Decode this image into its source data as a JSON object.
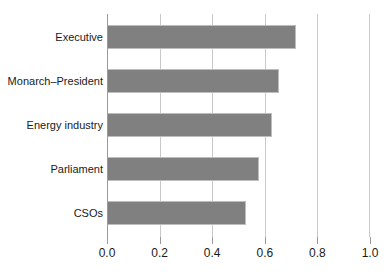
{
  "chart_data": {
    "type": "bar",
    "orientation": "horizontal",
    "title": "",
    "subtitle": "",
    "xlabel": "",
    "ylabel": "",
    "categories": [
      "Executive",
      "Monarch–President",
      "Energy industry",
      "Parliament",
      "CSOs"
    ],
    "values": [
      0.72,
      0.655,
      0.627,
      0.578,
      0.528
    ],
    "series": [
      {
        "name": "",
        "values": [
          0.72,
          0.655,
          0.627,
          0.578,
          0.528
        ]
      }
    ],
    "xlim": [
      0.0,
      1.0
    ],
    "xticks": [
      0.0,
      0.2,
      0.4,
      0.6,
      0.8,
      1.0
    ],
    "xtick_labels": [
      "0.0",
      "0.2",
      "0.4",
      "0.6",
      "0.8",
      "1.0"
    ],
    "grid": "vertical",
    "legend": "none",
    "bar_color": "#808080",
    "bar_edge_color": "#bdbdbd",
    "gridline_color": "#c9c9c9",
    "axis_color": "#9a9a9a",
    "background_color": "#ffffff",
    "text_color": "#1a1a1a"
  }
}
